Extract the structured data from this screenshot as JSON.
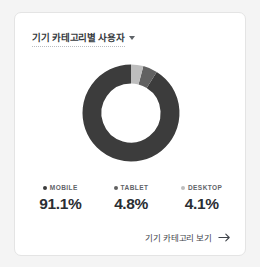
{
  "card": {
    "title": "기기 카테고리별 사용자",
    "dropdown_icon": "chevron-down-icon",
    "footer": {
      "link_text": "기기 카테고리 보기",
      "arrow_icon": "arrow-right-icon"
    }
  },
  "colors": {
    "mobile": "#3c3c3c",
    "tablet": "#616161",
    "desktop": "#bdbdbd",
    "card_background": "#ffffff",
    "page_background": "#f4f4f4",
    "card_border": "#e4e4e4",
    "title_text": "#35383c",
    "value_text": "#2b2e33",
    "label_text": "#5f6368"
  },
  "legend": [
    {
      "label": "MOBILE",
      "value": "91.1%",
      "color": "#3c3c3c"
    },
    {
      "label": "TABLET",
      "value": "4.8%",
      "color": "#616161"
    },
    {
      "label": "DESKTOP",
      "value": "4.1%",
      "color": "#bdbdbd"
    }
  ],
  "chart_data": {
    "type": "pie",
    "variant": "donut",
    "title": "기기 카테고리별 사용자",
    "categories": [
      "MOBILE",
      "TABLET",
      "DESKTOP"
    ],
    "values": [
      91.1,
      4.8,
      4.1
    ],
    "unit": "%",
    "colors": [
      "#3c3c3c",
      "#616161",
      "#bdbdbd"
    ],
    "start_angle": 0,
    "direction": "counterclockwise",
    "inner_radius_ratio": 0.61,
    "legend_position": "bottom",
    "grid": false
  }
}
